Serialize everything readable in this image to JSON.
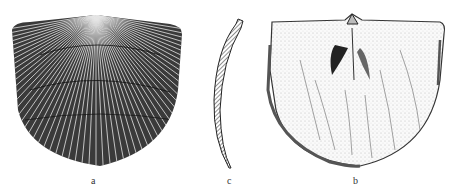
{
  "plate": {
    "description": "Brachiopod shell illustrations",
    "figures": [
      {
        "id": "a",
        "label": "a",
        "view": "exterior of valve, radially ribbed"
      },
      {
        "id": "c",
        "label": "c",
        "view": "cross-section profile, hatched"
      },
      {
        "id": "b",
        "label": "b",
        "view": "interior of valve"
      }
    ]
  },
  "colors": {
    "ink": "#1a1a1a",
    "paper": "#ffffff",
    "shade": "#555555"
  }
}
